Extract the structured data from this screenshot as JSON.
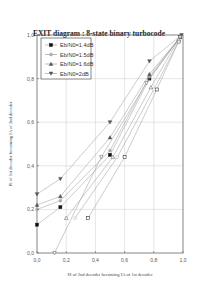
{
  "chart_data": {
    "type": "line",
    "title": "EXIT diagram : 8-state binary turbocode",
    "xlabel": "IS of 2nd decoder becoming IA of 1st decoder",
    "ylabel": "IS of 1st decoder becoming IA of 2nd decoder",
    "xlim": [
      0,
      1.0
    ],
    "ylim": [
      0,
      1.0
    ],
    "xticks": [
      "0,0",
      "0,2",
      "0,4",
      "0,6",
      "0,8",
      "1,0"
    ],
    "yticks": [
      "0,0",
      "0,2",
      "0,4",
      "0,6",
      "0,8",
      "1,0"
    ],
    "grid": true,
    "legend_position": "upper left",
    "series": [
      {
        "name": "Eb/N0=1.4dB",
        "marker": "square-filled",
        "decoder1": {
          "x": [
            0.0,
            0.16,
            0.5,
            0.77,
            0.98
          ],
          "y": [
            0.13,
            0.21,
            0.45,
            0.8,
            0.99
          ]
        },
        "decoder2": {
          "x": [
            0.35,
            0.6,
            0.82,
            0.97
          ],
          "y": [
            0.16,
            0.44,
            0.75,
            0.97
          ]
        }
      },
      {
        "name": "Eb/N0=1.5dB",
        "marker": "circle-filled",
        "decoder1": {
          "x": [
            0.0,
            0.16,
            0.5,
            0.77,
            0.98
          ],
          "y": [
            0.2,
            0.24,
            0.47,
            0.81,
            0.99
          ]
        },
        "decoder2": {
          "x": [
            0.26,
            0.55,
            0.8,
            0.97
          ],
          "y": [
            0.16,
            0.44,
            0.75,
            0.97
          ]
        }
      },
      {
        "name": "Eb/N0=1.6dB",
        "marker": "triangle-up-filled",
        "decoder1": {
          "x": [
            0.0,
            0.16,
            0.5,
            0.77,
            0.98
          ],
          "y": [
            0.22,
            0.26,
            0.53,
            0.82,
            0.99
          ]
        },
        "decoder2": {
          "x": [
            0.2,
            0.52,
            0.78,
            0.97
          ],
          "y": [
            0.16,
            0.44,
            0.76,
            0.98
          ]
        }
      },
      {
        "name": "Eb/N0=2dB",
        "marker": "triangle-down-filled",
        "decoder1": {
          "x": [
            0.0,
            0.16,
            0.5,
            0.77,
            0.99
          ],
          "y": [
            0.27,
            0.34,
            0.6,
            0.88,
            1.0
          ]
        },
        "decoder2": {
          "x": [
            0.12,
            0.44,
            0.75,
            0.98
          ],
          "y": [
            0.0,
            0.44,
            0.78,
            0.99
          ]
        }
      }
    ]
  },
  "labels": {
    "title": "EXIT diagram : 8-state binary turbocode",
    "xlabel": "IS of 2nd decoder becoming IA of 1st decoder",
    "ylabel": "IS of 1st decoder becoming IA of 2nd decoder",
    "legend": [
      "Eb/N0=1.4dB",
      "Eb/N0=1.5dB",
      "Eb/N0=1.6dB",
      "Eb/N0=2dB"
    ],
    "xticks": [
      "0,0",
      "0,2",
      "0,4",
      "0,6",
      "0,8",
      "1,0"
    ],
    "yticks": [
      "0,0",
      "0,2",
      "0,4",
      "0,6",
      "0,8",
      "1,0"
    ]
  }
}
